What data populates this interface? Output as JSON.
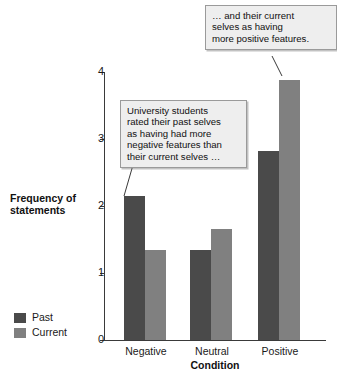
{
  "chart_data": {
    "type": "bar",
    "title": "",
    "xlabel": "Condition",
    "ylabel": "Frequency of statements",
    "categories": [
      "Negative",
      "Neutral",
      "Positive"
    ],
    "series": [
      {
        "name": "Past",
        "color": "#4a4a4a",
        "values": [
          2.15,
          1.35,
          2.82
        ]
      },
      {
        "name": "Current",
        "color": "#808080",
        "values": [
          1.35,
          1.65,
          3.88
        ]
      }
    ],
    "ylim": [
      0,
      4
    ],
    "yticks": [
      "0",
      "1",
      "2",
      "3",
      "4"
    ],
    "grid": false,
    "legend_position": "bottom-left",
    "annotations": [
      {
        "id": "callout-past",
        "text": "University students\nrated their past selves\nas having had more\nnegative features than\ntheir current selves …",
        "points_to": "Negative / Past bar"
      },
      {
        "id": "callout-current",
        "text": "… and their current\nselves as having\nmore positive features.",
        "points_to": "Positive / Current bar"
      }
    ]
  },
  "legend": {
    "items": [
      {
        "label": "Past",
        "color": "#4a4a4a"
      },
      {
        "label": "Current",
        "color": "#808080"
      }
    ]
  },
  "axis": {
    "y_title": "Frequency of\nstatements",
    "x_title": "Condition"
  }
}
